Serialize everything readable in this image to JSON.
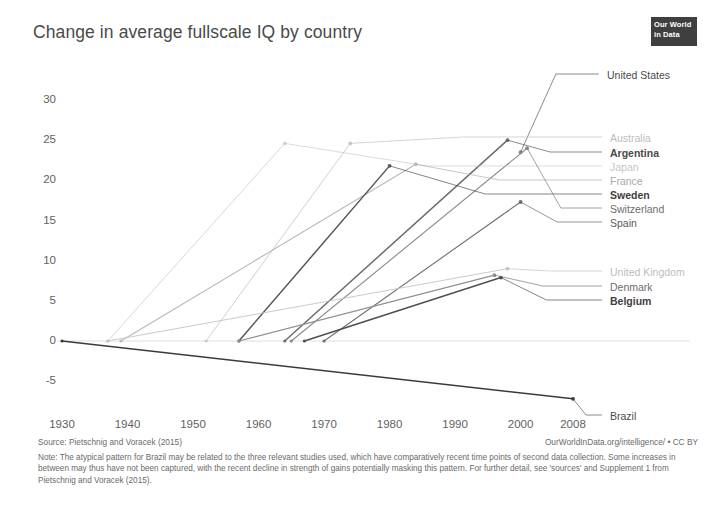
{
  "header": {
    "title": "Change in average fullscale IQ by country",
    "logo_line1": "Our World",
    "logo_line2": "in Data"
  },
  "footer": {
    "source": "Source: Pietschnig and Voracek (2015)",
    "credit": "OurWorldInData.org/intelligence/ • CC BY",
    "note": "Note: The atypical pattern for Brazil may be related to the three relevant studies used, which have comparatively recent time points of second data collection. Some increases in between may thus have not been captured, with the recent decline in strength of gains potentially masking this pattern. For further detail, see 'sources' and Supplement 1 from Pietschnig and Voracek (2015)."
  },
  "chart_data": {
    "type": "line",
    "title": "Change in average fullscale IQ by country",
    "xlabel": "",
    "ylabel": "",
    "xlim": [
      1930,
      2008
    ],
    "ylim": [
      -7.5,
      31
    ],
    "grid": false,
    "legend": "right",
    "yticks": [
      "30",
      "25",
      "20",
      "15",
      "10",
      "5",
      "0",
      "-5"
    ],
    "ytick_values": [
      30,
      25,
      20,
      15,
      10,
      5,
      0,
      -5
    ],
    "xticks": [
      "1930",
      "1940",
      "1950",
      "1960",
      "1970",
      "1980",
      "1990",
      "2000",
      "2008"
    ],
    "xtick_values": [
      1930,
      1940,
      1950,
      1960,
      1970,
      1980,
      1990,
      2000,
      2008
    ],
    "series": [
      {
        "name": "United States",
        "color": "#8c8c8c",
        "emphasis": "normal",
        "marker_only": true,
        "x": [
          2000
        ],
        "y": [
          23.5
        ]
      },
      {
        "name": "Australia",
        "color": "#c9c9c9",
        "emphasis": "faint",
        "x": [
          1952,
          1974
        ],
        "y": [
          0,
          24.6
        ]
      },
      {
        "name": "Argentina",
        "color": "#6d6d6d",
        "emphasis": "bold",
        "x": [
          1964,
          1998
        ],
        "y": [
          0,
          25.0
        ]
      },
      {
        "name": "Japan",
        "color": "#d2d2d2",
        "emphasis": "faint",
        "x": [
          1937,
          1964
        ],
        "y": [
          0,
          24.6
        ]
      },
      {
        "name": "France",
        "color": "#b9b9b9",
        "emphasis": "normal",
        "x": [
          1939,
          1984
        ],
        "y": [
          0,
          22.0
        ]
      },
      {
        "name": "Sweden",
        "color": "#585858",
        "emphasis": "bold",
        "x": [
          1957,
          1980
        ],
        "y": [
          0,
          21.8
        ]
      },
      {
        "name": "Switzerland",
        "color": "#8a8a8a",
        "emphasis": "normal",
        "x": [
          1965,
          2001
        ],
        "y": [
          0,
          24.0
        ]
      },
      {
        "name": "Spain",
        "color": "#707070",
        "emphasis": "normal",
        "x": [
          1970,
          2000
        ],
        "y": [
          0,
          17.3
        ]
      },
      {
        "name": "United Kingdom",
        "color": "#c4c4c4",
        "emphasis": "faint",
        "x": [
          1937,
          1998
        ],
        "y": [
          0,
          9.0
        ]
      },
      {
        "name": "Denmark",
        "color": "#8f8f8f",
        "emphasis": "normal",
        "x": [
          1957,
          1996
        ],
        "y": [
          0,
          8.2
        ]
      },
      {
        "name": "Belgium",
        "color": "#4f4f4f",
        "emphasis": "bold",
        "x": [
          1967,
          1997
        ],
        "y": [
          0,
          7.9
        ]
      },
      {
        "name": "Brazil",
        "color": "#3a3a3a",
        "emphasis": "bold",
        "x": [
          1930,
          2008
        ],
        "y": [
          0,
          -7.2
        ]
      }
    ],
    "label_groups": [
      {
        "label": "United States",
        "x": 607,
        "y": 70,
        "color": "#4a4a4a",
        "weight": "400"
      },
      {
        "label": "Australia",
        "x": 610,
        "y": 133,
        "color": "#bdbdbd",
        "weight": "400"
      },
      {
        "label": "Argentina",
        "x": 610,
        "y": 148,
        "color": "#4a4a4a",
        "weight": "700"
      },
      {
        "label": "Japan",
        "x": 610,
        "y": 162,
        "color": "#c6c6c6",
        "weight": "400"
      },
      {
        "label": "France",
        "x": 610,
        "y": 176,
        "color": "#a9a9a9",
        "weight": "400"
      },
      {
        "label": "Sweden",
        "x": 610,
        "y": 190,
        "color": "#3f3f3f",
        "weight": "700"
      },
      {
        "label": "Switzerland",
        "x": 610,
        "y": 204,
        "color": "#6d6d6d",
        "weight": "400"
      },
      {
        "label": "Spain",
        "x": 610,
        "y": 218,
        "color": "#5a5a5a",
        "weight": "400"
      },
      {
        "label": "United Kingdom",
        "x": 610,
        "y": 267,
        "color": "#bdbdbd",
        "weight": "400"
      },
      {
        "label": "Denmark",
        "x": 610,
        "y": 282,
        "color": "#6d6d6d",
        "weight": "400"
      },
      {
        "label": "Belgium",
        "x": 610,
        "y": 296,
        "color": "#3f3f3f",
        "weight": "700"
      },
      {
        "label": "Brazil",
        "x": 610,
        "y": 411,
        "color": "#4a4a4a",
        "weight": "400"
      }
    ]
  }
}
